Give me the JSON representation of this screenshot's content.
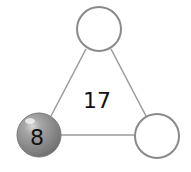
{
  "diagram": {
    "type": "triangle-number-puzzle",
    "center_value": "17",
    "nodes": [
      {
        "position": "top",
        "value": "",
        "filled": false
      },
      {
        "position": "bottom-left",
        "value": "8",
        "filled": true
      },
      {
        "position": "bottom-right",
        "value": "",
        "filled": false
      }
    ],
    "colors": {
      "edge": "#9a9a9a",
      "circle_stroke": "#8a8a8a",
      "filled_circle": "#8c8c8c",
      "text": "#111111"
    }
  }
}
